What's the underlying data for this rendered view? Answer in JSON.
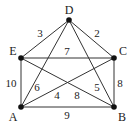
{
  "diagram": {
    "type": "weighted-graph",
    "nodes": [
      {
        "id": "D",
        "label": "D",
        "x": 69,
        "y": 20,
        "lx": 69,
        "ly": 14
      },
      {
        "id": "E",
        "label": "E",
        "x": 21,
        "y": 58,
        "lx": 13,
        "ly": 55
      },
      {
        "id": "C",
        "label": "C",
        "x": 114,
        "y": 58,
        "lx": 123,
        "ly": 55
      },
      {
        "id": "A",
        "label": "A",
        "x": 21,
        "y": 107,
        "lx": 13,
        "ly": 121
      },
      {
        "id": "B",
        "label": "B",
        "x": 114,
        "y": 107,
        "lx": 122,
        "ly": 121
      }
    ],
    "edges": [
      {
        "from": "D",
        "to": "E",
        "weight": "3",
        "wx": 40,
        "wy": 37
      },
      {
        "from": "D",
        "to": "C",
        "weight": "2",
        "wx": 97,
        "wy": 37
      },
      {
        "from": "D",
        "to": "A",
        "weight": "6",
        "wx": 37,
        "wy": 91
      },
      {
        "from": "D",
        "to": "B",
        "weight": "5",
        "wx": 97,
        "wy": 91
      },
      {
        "from": "E",
        "to": "C",
        "weight": "7",
        "wx": 67,
        "wy": 55
      },
      {
        "from": "E",
        "to": "A",
        "weight": "10",
        "wx": 11,
        "wy": 87
      },
      {
        "from": "E",
        "to": "B",
        "weight": "8",
        "wx": 77,
        "wy": 99
      },
      {
        "from": "C",
        "to": "A",
        "weight": "4",
        "wx": 57,
        "wy": 99
      },
      {
        "from": "C",
        "to": "B",
        "weight": "8",
        "wx": 120,
        "wy": 87
      },
      {
        "from": "A",
        "to": "B",
        "weight": "9",
        "wx": 67,
        "wy": 119
      }
    ],
    "colors": {
      "line": "#333333",
      "node": "#111111",
      "text": "#222222"
    }
  }
}
